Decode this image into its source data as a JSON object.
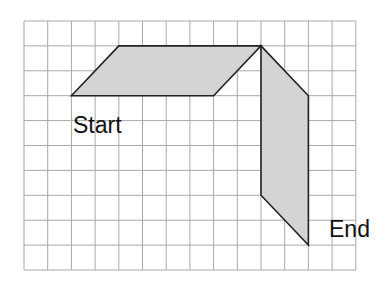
{
  "diagram": {
    "grid": {
      "cols": 14,
      "rows": 10,
      "origin_x": 24,
      "origin_y": 21,
      "cell_w": 23.7,
      "cell_h": 24.9,
      "line_color": "#a8a8a8"
    },
    "shapes": [
      {
        "name": "horizontal-parallelogram",
        "points_grid": [
          [
            2,
            3
          ],
          [
            4,
            1
          ],
          [
            10,
            1
          ],
          [
            8,
            3
          ]
        ],
        "fill": "#d4d4d4",
        "stroke": "#222222"
      },
      {
        "name": "vertical-parallelogram",
        "points_grid": [
          [
            10,
            1
          ],
          [
            12,
            3
          ],
          [
            12,
            9
          ],
          [
            10,
            7
          ]
        ],
        "fill": "#d4d4d4",
        "stroke": "#222222"
      }
    ],
    "labels": {
      "start": "Start",
      "end": "End"
    }
  }
}
